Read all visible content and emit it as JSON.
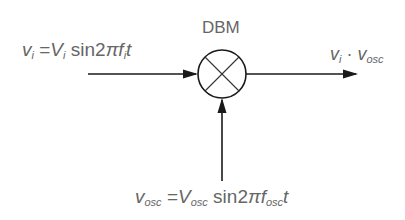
{
  "diagram": {
    "block_label": "DBM",
    "block_symbol": "multiplier",
    "input": {
      "var": "v",
      "var_sub": "i",
      "equals": "=",
      "amp": "V",
      "amp_sub": "i",
      "func": "sin2",
      "pi": "π",
      "freq": "f",
      "freq_sub": "i",
      "t": "t"
    },
    "output": {
      "a": "v",
      "a_sub": "i",
      "dot": "·",
      "b": "v",
      "b_sub": "osc"
    },
    "oscillator": {
      "var": "v",
      "var_sub": "osc",
      "equals": "=",
      "amp": "V",
      "amp_sub": "osc",
      "func": "sin2",
      "pi": "π",
      "freq": "f",
      "freq_sub": "osc",
      "t": "t"
    },
    "line_color": "#1a1a1a",
    "text_color": "#666666"
  }
}
